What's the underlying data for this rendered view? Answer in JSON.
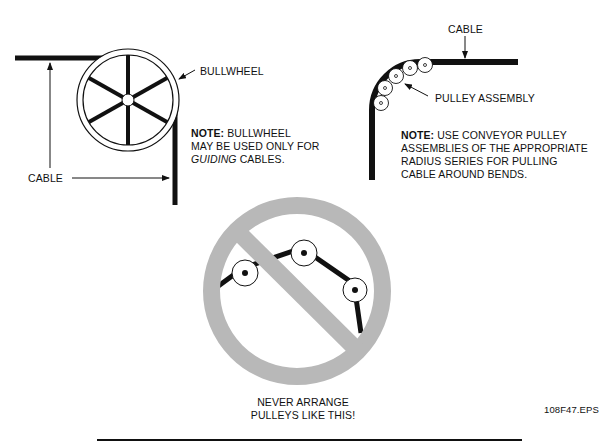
{
  "figure_id": "108F47.EPS",
  "colors": {
    "ink": "#111111",
    "prohibition_gray": "#b8b8b8",
    "background": "#ffffff"
  },
  "bullwheel_panel": {
    "callout_label": "BULLWHEEL",
    "cable_label": "CABLE",
    "note": {
      "prefix": "NOTE:",
      "line1_rest": " BULLWHEEL",
      "line2": "MAY BE USED ONLY FOR",
      "line3_italic": "GUIDING",
      "line3_rest": " CABLES."
    }
  },
  "pulley_panel": {
    "cable_label": "CABLE",
    "callout_label": "PULLEY ASSEMBLY",
    "note": {
      "prefix": "NOTE:",
      "line1_rest": " USE CONVEYOR PULLEY",
      "line2": "ASSEMBLIES OF THE APPROPRIATE",
      "line3": "RADIUS SERIES FOR PULLING",
      "line4": "CABLE AROUND BENDS."
    },
    "pulley_count": 5
  },
  "prohibition_panel": {
    "caption_line1": "NEVER ARRANGE",
    "caption_line2": "PULLEYS LIKE THIS!",
    "pulley_count": 3
  }
}
